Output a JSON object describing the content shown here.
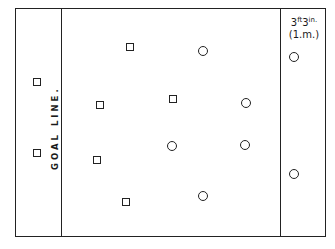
{
  "diagram": {
    "goal_line_label": "GOAL LINE.",
    "zone_label_line1_main": "3",
    "zone_label_line1_sup1": "ft",
    "zone_label_line1_mid": "3",
    "zone_label_line1_sup2": "in.",
    "zone_label_line2": "(1.m.)",
    "field": {
      "left": 15,
      "top": 8,
      "right": 326,
      "bottom": 237
    },
    "lines": [
      {
        "name": "goal-line",
        "x": 61
      },
      {
        "name": "zone-line",
        "x": 280
      }
    ],
    "squares": [
      {
        "x": 37,
        "y": 82
      },
      {
        "x": 37,
        "y": 153
      },
      {
        "x": 130,
        "y": 47
      },
      {
        "x": 100,
        "y": 105
      },
      {
        "x": 173,
        "y": 99
      },
      {
        "x": 97,
        "y": 160
      },
      {
        "x": 126,
        "y": 202
      }
    ],
    "circles": [
      {
        "x": 203,
        "y": 51
      },
      {
        "x": 246,
        "y": 103
      },
      {
        "x": 172,
        "y": 146
      },
      {
        "x": 245,
        "y": 145
      },
      {
        "x": 203,
        "y": 196
      },
      {
        "x": 294,
        "y": 57
      },
      {
        "x": 294,
        "y": 174
      }
    ]
  }
}
